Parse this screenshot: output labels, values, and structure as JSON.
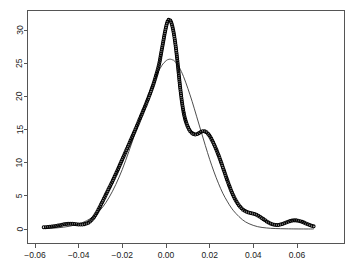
{
  "chart_data": {
    "type": "line",
    "title": "",
    "subtitle": "",
    "xlabel": "",
    "ylabel": "",
    "xlim": [
      -0.0565,
      0.0685
    ],
    "ylim": [
      -0.6,
      32.4
    ],
    "grid": false,
    "legend_position": "none",
    "xticks": [
      -0.06,
      -0.04,
      -0.02,
      0.0,
      0.02,
      0.04,
      0.06
    ],
    "xtick_labels": [
      "-0.06",
      "-0.04",
      "-0.02",
      "0.00",
      "0.02",
      "0.04",
      "0.06"
    ],
    "yticks": [
      0,
      5,
      10,
      15,
      20,
      25,
      30
    ],
    "ytick_labels": [
      "0",
      "5",
      "10",
      "15",
      "20",
      "25",
      "30"
    ],
    "series": [
      {
        "name": "empirical-density-points",
        "marker": "open-circle",
        "color": "#000000",
        "x": [
          -0.056,
          -0.0548,
          -0.0536,
          -0.0524,
          -0.0512,
          -0.05,
          -0.0488,
          -0.0476,
          -0.0464,
          -0.0452,
          -0.044,
          -0.0428,
          -0.0416,
          -0.0404,
          -0.0392,
          -0.038,
          -0.0368,
          -0.0356,
          -0.0344,
          -0.0332,
          -0.032,
          -0.0308,
          -0.0296,
          -0.0284,
          -0.0272,
          -0.026,
          -0.0248,
          -0.0236,
          -0.0224,
          -0.0212,
          -0.02,
          -0.0188,
          -0.0176,
          -0.0164,
          -0.0152,
          -0.014,
          -0.0128,
          -0.0116,
          -0.0104,
          -0.0092,
          -0.008,
          -0.0068,
          -0.0056,
          -0.0044,
          -0.0032,
          -0.0026,
          -0.002,
          -0.0014,
          -0.0008,
          -0.0002,
          0.0004,
          0.001,
          0.0016,
          0.0022,
          0.0028,
          0.0034,
          0.004,
          0.0046,
          0.0052,
          0.0058,
          0.0064,
          0.0072,
          0.008,
          0.009,
          0.01,
          0.011,
          0.0122,
          0.0134,
          0.0146,
          0.0158,
          0.017,
          0.0182,
          0.0194,
          0.0206,
          0.0218,
          0.023,
          0.0242,
          0.0254,
          0.0266,
          0.0278,
          0.029,
          0.0302,
          0.0314,
          0.0326,
          0.0338,
          0.035,
          0.0362,
          0.0376,
          0.039,
          0.0404,
          0.042,
          0.0436,
          0.0452,
          0.0468,
          0.0484,
          0.05,
          0.0516,
          0.0532,
          0.0548,
          0.0564,
          0.058,
          0.0596,
          0.0612,
          0.0628,
          0.0644,
          0.066,
          0.0676
        ],
        "y": [
          0.25,
          0.28,
          0.32,
          0.37,
          0.42,
          0.48,
          0.56,
          0.64,
          0.72,
          0.78,
          0.8,
          0.79,
          0.75,
          0.7,
          0.68,
          0.7,
          0.78,
          0.95,
          1.25,
          1.7,
          2.3,
          3.0,
          3.8,
          4.6,
          5.4,
          6.2,
          7.0,
          7.85,
          8.7,
          9.6,
          10.5,
          11.4,
          12.3,
          13.2,
          14.1,
          15.0,
          15.95,
          16.9,
          17.85,
          18.8,
          19.8,
          20.85,
          22.0,
          23.3,
          24.8,
          25.8,
          26.9,
          28.0,
          29.1,
          30.1,
          30.95,
          31.45,
          31.55,
          31.3,
          30.7,
          29.8,
          28.6,
          27.1,
          25.4,
          23.5,
          21.6,
          19.4,
          17.7,
          16.3,
          15.4,
          14.8,
          14.4,
          14.25,
          14.35,
          14.6,
          14.75,
          14.65,
          14.3,
          13.7,
          12.9,
          12.0,
          11.0,
          9.9,
          8.75,
          7.6,
          6.5,
          5.5,
          4.65,
          3.95,
          3.4,
          3.0,
          2.72,
          2.52,
          2.4,
          2.28,
          2.05,
          1.72,
          1.35,
          1.0,
          0.75,
          0.62,
          0.62,
          0.75,
          0.95,
          1.15,
          1.28,
          1.3,
          1.2,
          1.02,
          0.8,
          0.58,
          0.4
        ]
      },
      {
        "name": "fitted-normal-curve",
        "marker": "none",
        "color": "#3a3a3a",
        "x": [
          -0.056,
          -0.053,
          -0.05,
          -0.047,
          -0.044,
          -0.041,
          -0.038,
          -0.035,
          -0.032,
          -0.029,
          -0.026,
          -0.023,
          -0.02,
          -0.017,
          -0.014,
          -0.011,
          -0.008,
          -0.005,
          -0.002,
          0.0,
          0.001,
          0.002,
          0.003,
          0.004,
          0.006,
          0.008,
          0.01,
          0.012,
          0.014,
          0.016,
          0.018,
          0.02,
          0.022,
          0.024,
          0.026,
          0.028,
          0.03,
          0.032,
          0.035,
          0.038,
          0.042,
          0.046,
          0.05,
          0.055,
          0.06,
          0.0676
        ],
        "y": [
          0.06,
          0.1,
          0.17,
          0.27,
          0.43,
          0.66,
          1.0,
          1.5,
          2.25,
          3.3,
          4.8,
          6.7,
          9.0,
          11.7,
          14.6,
          17.5,
          20.3,
          22.7,
          24.6,
          25.35,
          25.55,
          25.6,
          25.5,
          25.3,
          24.4,
          23.0,
          21.2,
          19.2,
          17.0,
          14.8,
          12.6,
          10.5,
          8.6,
          6.9,
          5.4,
          4.2,
          3.15,
          2.35,
          1.4,
          0.8,
          0.35,
          0.16,
          0.07,
          0.03,
          0.01,
          0.0
        ]
      }
    ]
  },
  "axes": {
    "x_axis_name": "x-axis",
    "y_axis_name": "y-axis"
  }
}
